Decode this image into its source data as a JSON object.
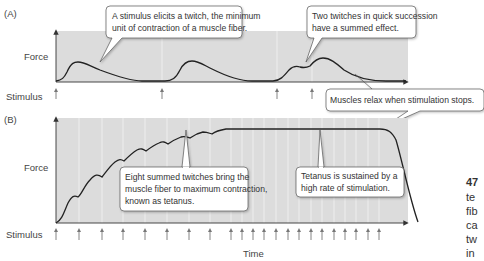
{
  "panel_a": {
    "label": "(A)",
    "y_label": "Force",
    "stimulus_label": "Stimulus",
    "stimulus_x": [
      56,
      162,
      277,
      312
    ],
    "callouts": [
      {
        "lines": [
          "A stimulus elicits a twitch, the minimum",
          "unit of contraction of a muscle fiber."
        ]
      },
      {
        "lines": [
          "Two twitches in quick succession",
          "have a summed effect."
        ]
      },
      {
        "lines": [
          "Muscles relax when stimulation stops."
        ]
      }
    ]
  },
  "panel_b": {
    "label": "(B)",
    "y_label": "Force",
    "stimulus_label": "Stimulus",
    "x_label": "Time",
    "stimulus_x": [
      56,
      79,
      102,
      123,
      145,
      167,
      189,
      210,
      231,
      242,
      253,
      264,
      276,
      288,
      299,
      311,
      322,
      334,
      345,
      356,
      368,
      379
    ],
    "callouts": [
      {
        "lines": [
          "Eight summed twitches bring the",
          "muscle fiber to maximum contraction,",
          "known as tetanus."
        ]
      },
      {
        "lines": [
          "Tetanus is sustained by a",
          "high rate of stimulation."
        ]
      }
    ]
  },
  "side_caption": {
    "lines": [
      "47",
      "te",
      "fib",
      "ca",
      "tw",
      "in"
    ]
  },
  "colors": {
    "plot_bg": "#dcdcdc",
    "curve": "#222222",
    "arrow": "#777777",
    "gridline": "#f2f2f2"
  }
}
